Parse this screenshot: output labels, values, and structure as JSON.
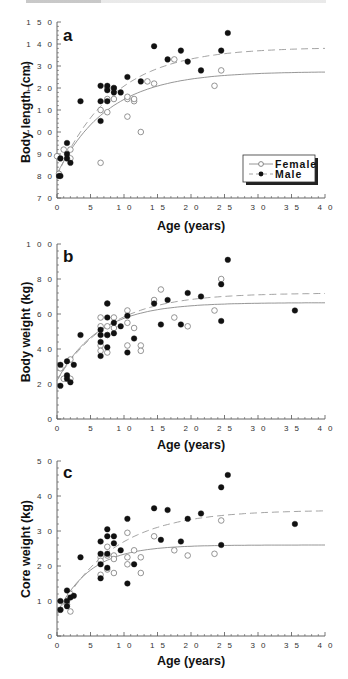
{
  "chart_data": [
    {
      "type": "scatter",
      "panel_label": "a",
      "title": "",
      "xlabel": "Age (years)",
      "ylabel": "Body length (cm)",
      "xlim": [
        0,
        40
      ],
      "ylim": [
        70,
        150
      ],
      "x_ticks": [
        0,
        5,
        10,
        15,
        20,
        25,
        30,
        35,
        40
      ],
      "y_ticks": [
        70,
        80,
        90,
        100,
        110,
        120,
        130,
        140,
        150
      ],
      "grid": false,
      "legend_position": "lower right",
      "legend": [
        "Female",
        "Male"
      ],
      "series": [
        {
          "name": "Female",
          "marker": "open-circle",
          "fit_line": "solid",
          "fit": {
            "asymptote": 127.5,
            "y0": 81,
            "k": 0.13
          },
          "points": [
            [
              0,
              89
            ],
            [
              0.3,
              81
            ],
            [
              1,
              92
            ],
            [
              2,
              92
            ],
            [
              2,
              88
            ],
            [
              6.5,
              110
            ],
            [
              6.5,
              86
            ],
            [
              7.5,
              109
            ],
            [
              7.5,
              115
            ],
            [
              7.5,
              120
            ],
            [
              8.5,
              120
            ],
            [
              8.5,
              115
            ],
            [
              10.5,
              115
            ],
            [
              10.5,
              116
            ],
            [
              10.5,
              107
            ],
            [
              11.5,
              114
            ],
            [
              11.5,
              115
            ],
            [
              12.5,
              100
            ],
            [
              13.5,
              123
            ],
            [
              14.5,
              122
            ],
            [
              17.5,
              133
            ],
            [
              23.5,
              121
            ],
            [
              24.5,
              128
            ]
          ]
        },
        {
          "name": "Male",
          "marker": "filled-circle",
          "fit_line": "dashed",
          "fit": {
            "asymptote": 138.5,
            "y0": 80,
            "k": 0.12
          },
          "points": [
            [
              0.3,
              80
            ],
            [
              0.5,
              80
            ],
            [
              0.5,
              88
            ],
            [
              1.5,
              95
            ],
            [
              1.5,
              90
            ],
            [
              1.5,
              88
            ],
            [
              2,
              86
            ],
            [
              3.5,
              114
            ],
            [
              6.5,
              121
            ],
            [
              6.5,
              114
            ],
            [
              6.5,
              105
            ],
            [
              7.5,
              121
            ],
            [
              7.5,
              119
            ],
            [
              7.5,
              114
            ],
            [
              8.5,
              120
            ],
            [
              8.5,
              118
            ],
            [
              9.5,
              118
            ],
            [
              10.5,
              125
            ],
            [
              12.5,
              123
            ],
            [
              14.5,
              139
            ],
            [
              16.5,
              133
            ],
            [
              18.5,
              137
            ],
            [
              19.5,
              132
            ],
            [
              21.5,
              128
            ],
            [
              24.5,
              137
            ],
            [
              25.5,
              145
            ]
          ]
        }
      ]
    },
    {
      "type": "scatter",
      "panel_label": "b",
      "title": "",
      "xlabel": "Age (years)",
      "ylabel": "Body weight (kg)",
      "xlim": [
        0,
        40
      ],
      "ylim": [
        0,
        100
      ],
      "x_ticks": [
        0,
        5,
        10,
        15,
        20,
        25,
        30,
        35,
        40
      ],
      "y_ticks": [
        0,
        20,
        40,
        60,
        80,
        100
      ],
      "grid": false,
      "series": [
        {
          "name": "Female",
          "marker": "open-circle",
          "fit_line": "solid",
          "fit": {
            "asymptote": 66.5,
            "y0": 22,
            "k": 0.16
          },
          "points": [
            [
              0.5,
              29
            ],
            [
              1,
              23
            ],
            [
              2,
              34
            ],
            [
              2,
              23
            ],
            [
              6.5,
              58
            ],
            [
              6.5,
              53
            ],
            [
              6.5,
              42
            ],
            [
              6.5,
              39
            ],
            [
              7.5,
              66
            ],
            [
              7.5,
              53
            ],
            [
              7.5,
              48
            ],
            [
              7.5,
              38
            ],
            [
              8.5,
              58
            ],
            [
              8.5,
              52
            ],
            [
              10.5,
              62
            ],
            [
              10.5,
              55
            ],
            [
              10.5,
              42
            ],
            [
              11.5,
              52
            ],
            [
              12.5,
              42
            ],
            [
              12.5,
              39
            ],
            [
              14.5,
              68
            ],
            [
              15.5,
              74
            ],
            [
              17.5,
              58
            ],
            [
              19.5,
              53
            ],
            [
              23.5,
              62
            ],
            [
              24.5,
              80
            ]
          ]
        },
        {
          "name": "Male",
          "marker": "filled-circle",
          "fit_line": "dashed",
          "fit": {
            "asymptote": 72,
            "y0": 22,
            "k": 0.13
          },
          "points": [
            [
              0.5,
              31
            ],
            [
              0.5,
              19
            ],
            [
              1.5,
              33
            ],
            [
              1.5,
              25
            ],
            [
              1.5,
              23
            ],
            [
              2,
              21
            ],
            [
              2.5,
              31
            ],
            [
              3.5,
              48
            ],
            [
              6.5,
              51
            ],
            [
              6.5,
              48
            ],
            [
              6.5,
              44
            ],
            [
              6.5,
              36
            ],
            [
              7.5,
              66
            ],
            [
              7.5,
              58
            ],
            [
              7.5,
              48
            ],
            [
              7.5,
              41
            ],
            [
              8.5,
              55
            ],
            [
              8.5,
              49
            ],
            [
              9.5,
              53
            ],
            [
              10.5,
              59
            ],
            [
              10.5,
              38
            ],
            [
              11.5,
              46
            ],
            [
              14.5,
              66
            ],
            [
              15.5,
              54
            ],
            [
              16.5,
              68
            ],
            [
              18.5,
              54
            ],
            [
              19.5,
              72
            ],
            [
              21.5,
              70
            ],
            [
              24.5,
              77
            ],
            [
              24.5,
              56
            ],
            [
              25.5,
              91
            ],
            [
              35.5,
              62
            ]
          ]
        }
      ]
    },
    {
      "type": "scatter",
      "panel_label": "c",
      "title": "",
      "xlabel": "Age (years)",
      "ylabel": "Core weight (kg)",
      "xlim": [
        0,
        40
      ],
      "ylim": [
        0,
        5
      ],
      "x_ticks": [
        0,
        5,
        10,
        15,
        20,
        25,
        30,
        35,
        40
      ],
      "y_ticks": [
        0,
        1,
        2,
        3,
        4,
        5
      ],
      "grid": false,
      "series": [
        {
          "name": "Female",
          "marker": "open-circle",
          "fit_line": "solid",
          "fit": {
            "asymptote": 2.6,
            "y0": 0.65,
            "k": 0.2
          },
          "points": [
            [
              0.5,
              0.75
            ],
            [
              1.5,
              0.9
            ],
            [
              2,
              1.2
            ],
            [
              2,
              0.7
            ],
            [
              6.5,
              2.25
            ],
            [
              6.5,
              2.15
            ],
            [
              6.5,
              1.75
            ],
            [
              7.5,
              2.55
            ],
            [
              7.5,
              2.3
            ],
            [
              7.5,
              1.9
            ],
            [
              8.5,
              2.3
            ],
            [
              8.5,
              2.2
            ],
            [
              8.5,
              1.8
            ],
            [
              10.5,
              2.95
            ],
            [
              10.5,
              2.25
            ],
            [
              10.5,
              2.05
            ],
            [
              11.5,
              2.45
            ],
            [
              12.5,
              2.25
            ],
            [
              12.5,
              1.8
            ],
            [
              14.5,
              2.85
            ],
            [
              17.5,
              2.45
            ],
            [
              19.5,
              2.3
            ],
            [
              23.5,
              2.35
            ],
            [
              24.5,
              3.3
            ]
          ]
        },
        {
          "name": "Male",
          "marker": "filled-circle",
          "fit_line": "dashed",
          "fit": {
            "asymptote": 3.6,
            "y0": 0.6,
            "k": 0.12
          },
          "points": [
            [
              0.5,
              1.0
            ],
            [
              0.5,
              0.75
            ],
            [
              1.5,
              1.3
            ],
            [
              1.5,
              1.0
            ],
            [
              1.5,
              0.85
            ],
            [
              2,
              1.1
            ],
            [
              2.5,
              1.15
            ],
            [
              3.5,
              2.25
            ],
            [
              6.5,
              2.35
            ],
            [
              6.5,
              2.05
            ],
            [
              6.5,
              1.65
            ],
            [
              6.5,
              2.7
            ],
            [
              7.5,
              3.05
            ],
            [
              7.5,
              2.85
            ],
            [
              7.5,
              2.35
            ],
            [
              7.5,
              1.95
            ],
            [
              8.5,
              2.85
            ],
            [
              8.5,
              2.65
            ],
            [
              9.5,
              2.45
            ],
            [
              10.5,
              3.35
            ],
            [
              10.5,
              1.5
            ],
            [
              11.5,
              2.05
            ],
            [
              14.5,
              3.65
            ],
            [
              15.5,
              2.75
            ],
            [
              16.5,
              3.6
            ],
            [
              18.5,
              2.7
            ],
            [
              19.5,
              3.35
            ],
            [
              21.5,
              3.5
            ],
            [
              24.5,
              4.25
            ],
            [
              24.5,
              2.6
            ],
            [
              25.5,
              4.6
            ],
            [
              35.5,
              3.2
            ]
          ]
        }
      ]
    }
  ],
  "legend": {
    "female_label": "Female",
    "male_label": "Male"
  },
  "panels": [
    {
      "letter": "a",
      "ylabel": "Body length (cm)",
      "xlabel": "Age (years)",
      "ytick_labels": [
        "7 0",
        "8 0",
        "9 0",
        "1 0 0",
        "1 1 0",
        "1 2 0",
        "1 3 0",
        "1 4 0",
        "1 5 0"
      ]
    },
    {
      "letter": "b",
      "ylabel": "Body weight (kg)",
      "xlabel": "Age (years)",
      "ytick_labels": [
        "0",
        "2 0",
        "4 0",
        "6 0",
        "8 0",
        "1 0 0"
      ]
    },
    {
      "letter": "c",
      "ylabel": "Core weight (kg)",
      "xlabel": "Age (years)",
      "ytick_labels": [
        "0",
        "1 0",
        "2 0",
        "3 0",
        "4 0",
        "5 0"
      ]
    }
  ],
  "xtick_labels": [
    "0",
    "5",
    "1 0",
    "1 5",
    "2 0",
    "2 5",
    "3 0",
    "3 5",
    "4 0"
  ],
  "colors": {
    "male_marker": "#111111",
    "female_marker": "#7a7a7a",
    "female_line": "#8a8a8a",
    "male_line": "#9a9a9a",
    "axis": "#555555"
  }
}
